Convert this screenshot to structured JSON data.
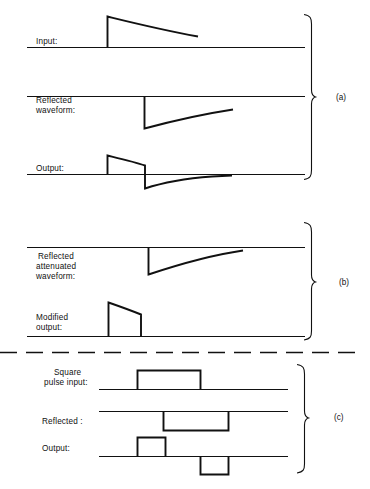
{
  "figure": {
    "kind": "waveform-timing-diagram",
    "background_color": "#ffffff",
    "ink_color": "#111111",
    "sections": [
      {
        "id": "a",
        "bracket_label": "(a)",
        "traces": [
          {
            "name": "input",
            "label": "Input:",
            "label_lines": [
              "Input:"
            ],
            "shape": "fast-rise-exponential-decay-positive"
          },
          {
            "name": "reflected-waveform",
            "label": "Reflected waveform:",
            "label_lines": [
              "Reflected",
              "waveform:"
            ],
            "shape": "fast-fall-exponential-recovery-negative"
          },
          {
            "name": "output",
            "label": "Output:",
            "label_lines": [
              "Output:"
            ],
            "shape": "positive-decay-then-negative-undershoot-recovery"
          }
        ]
      },
      {
        "id": "b",
        "bracket_label": "(b)",
        "traces": [
          {
            "name": "reflected-attenuated-waveform",
            "label": "Reflected attenuated waveform:",
            "label_lines": [
              "Reflected",
              "attenuated",
              "waveform:"
            ],
            "shape": "fast-fall-exponential-recovery-negative-attenuated"
          },
          {
            "name": "modified-output",
            "label": "Modified output:",
            "label_lines": [
              "Modified",
              "output:"
            ],
            "shape": "positive-pulse-slight-droop"
          }
        ]
      },
      {
        "id": "c",
        "bracket_label": "(c)",
        "traces": [
          {
            "name": "square-pulse-input",
            "label": "Square pulse input:",
            "label_lines": [
              "Square",
              "pulse input:"
            ],
            "shape": "square-pulse-positive"
          },
          {
            "name": "reflected",
            "label": "Reflected :",
            "label_lines": [
              "Reflected :"
            ],
            "shape": "square-pulse-negative-delayed"
          },
          {
            "name": "output-c",
            "label": "Output:",
            "label_lines": [
              "Output:"
            ],
            "shape": "short-positive-pulse-then-short-negative-pulse"
          }
        ]
      }
    ],
    "divider": {
      "name": "dashed-divider",
      "style": "dashed-horizontal"
    }
  }
}
